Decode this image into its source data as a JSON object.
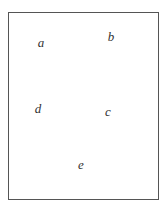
{
  "diagram": {
    "labels": [
      {
        "text": "a",
        "x": 41,
        "y": 42
      },
      {
        "text": "b",
        "x": 111,
        "y": 36
      },
      {
        "text": "c",
        "x": 108,
        "y": 111
      },
      {
        "text": "d",
        "x": 38,
        "y": 108
      },
      {
        "text": "e",
        "x": 81,
        "y": 164
      }
    ],
    "border_color": "#555555",
    "text_color": "#333333"
  }
}
